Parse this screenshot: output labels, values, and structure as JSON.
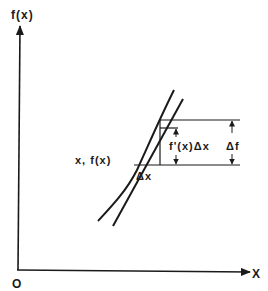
{
  "diagram": {
    "y_axis_label": "f(x)",
    "x_axis_label": "X",
    "origin_label": "O",
    "point_label": "x, f(x)",
    "delta_x_label": "Δx",
    "tangent_increment_label": "f'(x)Δx",
    "delta_f_label": "Δf",
    "colors": {
      "ink": "#1a1a1a",
      "background": "#ffffff"
    }
  }
}
